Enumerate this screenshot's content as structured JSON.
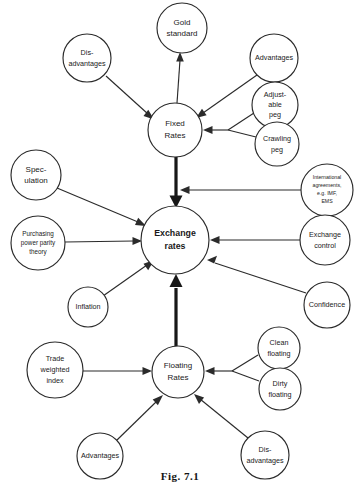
{
  "figure": {
    "caption": "Fig. 7.1"
  },
  "colors": {
    "stroke": "#2b2b2b",
    "stroke_thick": "#171717",
    "node_fill": "#ffffff",
    "background": "#ffffff",
    "text": "#1a1a1a"
  },
  "nodes": [
    {
      "id": "gold-standard",
      "label": "Gold standard",
      "lines": [
        "Gold",
        "standard"
      ],
      "cx": 182,
      "cy": 28,
      "r": 25,
      "size": "t-10"
    },
    {
      "id": "disadvantages-fixed",
      "label": "Dis-advantages",
      "lines": [
        "Dis-",
        "advantages"
      ],
      "cx": 87,
      "cy": 58,
      "r": 24,
      "size": "t-9"
    },
    {
      "id": "advantages-fixed",
      "label": "Advantages",
      "lines": [
        "Advantages"
      ],
      "cx": 274,
      "cy": 58,
      "r": 24,
      "size": "t-9"
    },
    {
      "id": "adjustable-peg",
      "label": "Adjustable peg",
      "lines": [
        "Adjust-",
        "able",
        "peg"
      ],
      "cx": 275,
      "cy": 105,
      "r": 23,
      "size": "t-9"
    },
    {
      "id": "crawling-peg",
      "label": "Crawling peg",
      "lines": [
        "Crawling",
        "peg"
      ],
      "cx": 277,
      "cy": 144,
      "r": 22,
      "size": "t-9"
    },
    {
      "id": "fixed-rates",
      "label": "Fixed Rates",
      "lines": [
        "Fixed",
        "Rates"
      ],
      "cx": 175,
      "cy": 130,
      "r": 27,
      "size": "t-10"
    },
    {
      "id": "international-agreements",
      "label": "International agreements, e.g. IMF, EMS",
      "lines": [
        "International",
        "agreements,",
        "e.g. IMF,",
        "EMS"
      ],
      "cx": 327,
      "cy": 190,
      "r": 26,
      "size": "t-7"
    },
    {
      "id": "speculation",
      "label": "Speculation",
      "lines": [
        "Spec-",
        "ulation"
      ],
      "cx": 36,
      "cy": 175,
      "r": 25,
      "size": "t-10"
    },
    {
      "id": "purchasing-power-parity",
      "label": "Purchasing power parity theory",
      "lines": [
        "Purchasing",
        "power parity",
        "theory"
      ],
      "cx": 38,
      "cy": 243,
      "r": 27,
      "size": "t-8"
    },
    {
      "id": "exchange-rates",
      "label": "Exchange rates",
      "lines": [
        "Exchange",
        "rates"
      ],
      "cx": 175,
      "cy": 240,
      "r": 34,
      "size": "t-center"
    },
    {
      "id": "exchange-control",
      "label": "Exchange control",
      "lines": [
        "Exchange",
        "control"
      ],
      "cx": 325,
      "cy": 240,
      "r": 25,
      "size": "t-9"
    },
    {
      "id": "inflation",
      "label": "Inflation",
      "lines": [
        "Inflation"
      ],
      "cx": 88,
      "cy": 307,
      "r": 20,
      "size": "t-9"
    },
    {
      "id": "confidence",
      "label": "Confidence",
      "lines": [
        "Confidence"
      ],
      "cx": 327,
      "cy": 305,
      "r": 23,
      "size": "t-9"
    },
    {
      "id": "clean-floating",
      "label": "Clean floating",
      "lines": [
        "Clean",
        "floating"
      ],
      "cx": 279,
      "cy": 348,
      "r": 21,
      "size": "t-9"
    },
    {
      "id": "dirty-floating",
      "label": "Dirty floating",
      "lines": [
        "Dirty",
        "floating"
      ],
      "cx": 280,
      "cy": 389,
      "r": 21,
      "size": "t-9"
    },
    {
      "id": "trade-weighted-index",
      "label": "Trade weighted index",
      "lines": [
        "Trade",
        "weighted",
        "index"
      ],
      "cx": 55,
      "cy": 370,
      "r": 28,
      "size": "t-9"
    },
    {
      "id": "floating-rates",
      "label": "Floating Rates",
      "lines": [
        "Floating",
        "Rates"
      ],
      "cx": 178,
      "cy": 372,
      "r": 26,
      "size": "t-10"
    },
    {
      "id": "advantages-floating",
      "label": "Advantages",
      "lines": [
        "Advantages"
      ],
      "cx": 100,
      "cy": 456,
      "r": 23,
      "size": "t-9"
    },
    {
      "id": "disadvantages-floating",
      "label": "Dis-advantages",
      "lines": [
        "Dis-",
        "advantages"
      ],
      "cx": 265,
      "cy": 455,
      "r": 24,
      "size": "t-9"
    }
  ],
  "edges": [
    {
      "id": "edge-fixed-to-gold",
      "from": "fixed-rates",
      "to": "gold-standard",
      "style": "thin"
    },
    {
      "id": "edge-disadvantages-to-fixed",
      "from": "disadvantages-fixed",
      "to": "fixed-rates",
      "style": "thin"
    },
    {
      "id": "edge-advantages-to-fixed",
      "from": "advantages-fixed",
      "to": "fixed-rates",
      "style": "thin"
    },
    {
      "id": "edge-pegs-to-fixed",
      "from": "adjustable-peg + crawling-peg",
      "to": "fixed-rates",
      "style": "thin-junction"
    },
    {
      "id": "edge-fixed-to-exchange",
      "from": "fixed-rates",
      "to": "exchange-rates",
      "style": "thick"
    },
    {
      "id": "edge-international-to-trunk",
      "from": "international-agreements",
      "to": "fixed-exchange-trunk",
      "style": "thin"
    },
    {
      "id": "edge-speculation-to-exchange",
      "from": "speculation",
      "to": "exchange-rates",
      "style": "thin"
    },
    {
      "id": "edge-ppp-to-exchange",
      "from": "purchasing-power-parity",
      "to": "exchange-rates",
      "style": "thin"
    },
    {
      "id": "edge-inflation-to-exchange",
      "from": "inflation",
      "to": "exchange-rates",
      "style": "thin"
    },
    {
      "id": "edge-exchange-control-to-exchange",
      "from": "exchange-control",
      "to": "exchange-rates",
      "style": "thin"
    },
    {
      "id": "edge-confidence-to-exchange",
      "from": "confidence",
      "to": "exchange-rates",
      "style": "thin"
    },
    {
      "id": "edge-floating-to-exchange",
      "from": "floating-rates",
      "to": "exchange-rates",
      "style": "thick"
    },
    {
      "id": "edge-trade-index-to-floating",
      "from": "trade-weighted-index",
      "to": "floating-rates",
      "style": "thin"
    },
    {
      "id": "edge-floatings-to-floating",
      "from": "clean-floating + dirty-floating",
      "to": "floating-rates",
      "style": "thin-junction"
    },
    {
      "id": "edge-advantages-to-floating",
      "from": "advantages-floating",
      "to": "floating-rates",
      "style": "thin"
    },
    {
      "id": "edge-disadvantages-to-floating",
      "from": "disadvantages-floating",
      "to": "floating-rates",
      "style": "thin"
    }
  ]
}
